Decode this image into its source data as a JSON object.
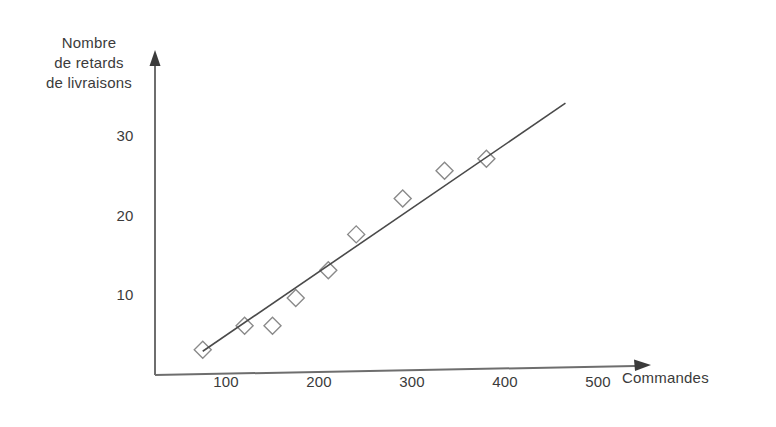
{
  "chart_data": {
    "type": "scatter",
    "title": "",
    "xlabel": "Commandes",
    "ylabel": "Nombre de retards de livraisons",
    "ylabel_lines": [
      "Nombre",
      "de retards",
      "de livraisons"
    ],
    "xticks": [
      100,
      200,
      300,
      400,
      500
    ],
    "xtick_labels": [
      "100",
      "200",
      "300",
      "400",
      "500"
    ],
    "yticks": [
      10,
      20,
      30
    ],
    "ytick_labels": [
      "10",
      "20",
      "30"
    ],
    "xlim": [
      0,
      530
    ],
    "ylim": [
      0,
      35
    ],
    "grid": false,
    "legend": false,
    "marker": "open-diamond",
    "series": [
      {
        "name": "Retards de livraisons",
        "x": [
          75,
          120,
          150,
          175,
          210,
          240,
          290,
          335,
          380
        ],
        "y": [
          3,
          6,
          6,
          9.5,
          13,
          17.5,
          22,
          25.5,
          27
        ]
      }
    ],
    "trendline": {
      "type": "line",
      "x": [
        75,
        465
      ],
      "y": [
        2.8,
        34
      ]
    },
    "colors": {
      "axis": "#6e6e6e",
      "marker": "#8a8a8a",
      "trendline": "#4a4a4a",
      "text": "#3b3b3b",
      "background": "#ffffff"
    }
  }
}
